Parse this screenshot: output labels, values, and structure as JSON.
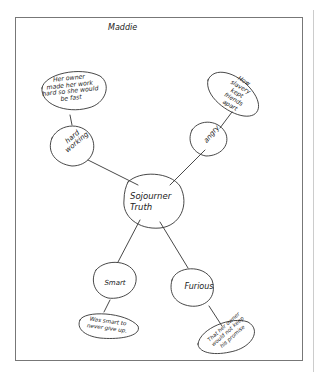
{
  "document": {
    "type": "handwritten concept web worksheet",
    "student_name": "Maddie"
  },
  "concept_map": {
    "center": {
      "label": "Sojourner\nTruth"
    },
    "branches": [
      {
        "id": "hard-working",
        "trait": "hard\nworking",
        "detail": "Her owner\nmade her work\nhard so she would\nbe fast"
      },
      {
        "id": "angry",
        "trait": "angry",
        "detail": "How\nslavery\nkept\nfriends\napart"
      },
      {
        "id": "smart",
        "trait": "Smart",
        "detail": "Was smart to\nnever give up."
      },
      {
        "id": "furious",
        "trait": "Furious",
        "detail": "That her owner\nwould not keep\nhis promise"
      }
    ]
  },
  "colors": {
    "ink": "#222222",
    "paper": "#ffffff",
    "frame": "#777777"
  }
}
